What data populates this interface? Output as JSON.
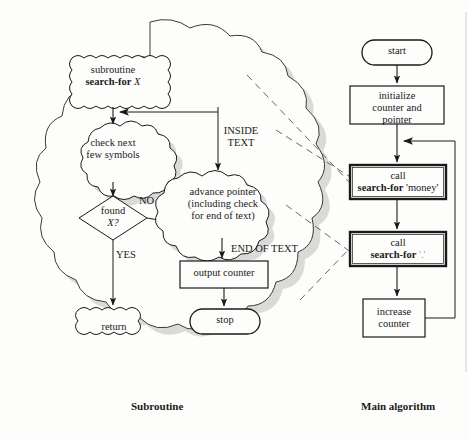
{
  "figure": {
    "captions": {
      "left": "Subroutine",
      "right": "Main algorithm"
    }
  },
  "colors": {
    "ink": "#1a1a1a",
    "shadow": "#c9c7c4",
    "faint": "#9a9a9a",
    "paper": "#fdfdfb"
  },
  "subroutine": {
    "nodes": {
      "entry": {
        "line1": "subroutine",
        "line2_bold": "search-for",
        "line2_italic": "X",
        "shape": "wavy-box"
      },
      "check": {
        "line1": "check next",
        "line2": "few symbols",
        "shape": "cloud"
      },
      "decision": {
        "line1": "found",
        "line2_italic": "X?",
        "shape": "diamond"
      },
      "advance": {
        "line1": "advance pointer",
        "line2": "(including check",
        "line3": "for end of text)",
        "shape": "cloud"
      },
      "output": {
        "label": "output counter",
        "shape": "rect"
      },
      "stop": {
        "label": "stop",
        "shape": "rounded"
      },
      "return": {
        "label": "return",
        "shape": "wavy-box"
      }
    },
    "edge_labels": {
      "no": "NO",
      "yes": "YES",
      "inside_text_l1": "INSIDE",
      "inside_text_l2": "TEXT",
      "end_of_text": "END OF TEXT"
    }
  },
  "main_algorithm": {
    "nodes": {
      "start": {
        "label": "start",
        "shape": "rounded"
      },
      "initialize": {
        "line1": "initialize",
        "line2": "counter  and",
        "line3": "pointer",
        "shape": "rect"
      },
      "call_money": {
        "line1": "call",
        "line2_bold": "search-for",
        "line2_arg": "'money'",
        "shape": "thick-rect"
      },
      "call_period": {
        "line1": "call",
        "line2_bold": "search-for",
        "line2_arg": "'.'",
        "shape": "thick-rect"
      },
      "increase": {
        "line1": "increase",
        "line2": "counter",
        "shape": "rect"
      }
    }
  }
}
